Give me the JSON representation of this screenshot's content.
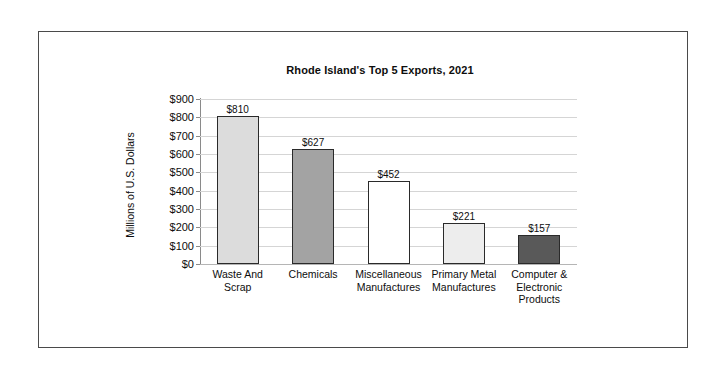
{
  "figure": {
    "border_color": "#4a4a4a",
    "background": "#ffffff"
  },
  "chart_data": {
    "type": "bar",
    "title": "Rhode Island's Top 5 Exports, 2021",
    "xlabel": "",
    "ylabel": "Millions of U.S. Dollars",
    "ylim": [
      0,
      900
    ],
    "ytick_step": 100,
    "grid": true,
    "legend": "none",
    "categories": [
      "Waste And Scrap",
      "Chemicals",
      "Miscellaneous Manufactures",
      "Primary Metal Manufactures",
      "Computer & Electronic Products"
    ],
    "category_lines": [
      [
        "Waste And",
        "Scrap"
      ],
      [
        "Chemicals"
      ],
      [
        "Miscellaneous",
        "Manufactures"
      ],
      [
        "Primary Metal",
        "Manufactures"
      ],
      [
        "Computer &",
        "Electronic",
        "Products"
      ]
    ],
    "values": [
      810,
      627,
      452,
      221,
      157
    ],
    "data_labels": [
      "$810",
      "$627",
      "$452",
      "$221",
      "$157"
    ],
    "bar_colors": [
      "#dcdcdc",
      "#a3a3a3",
      "#ffffff",
      "#ededed",
      "#595959"
    ],
    "bar_edge_color": "#2a2a2a",
    "ytick_labels": [
      "$900",
      "$800",
      "$700",
      "$600",
      "$500",
      "$400",
      "$300",
      "$200",
      "$100",
      "$0"
    ],
    "ytick_values": [
      900,
      800,
      700,
      600,
      500,
      400,
      300,
      200,
      100,
      0
    ],
    "gridline_color": "#d5d5d5"
  }
}
